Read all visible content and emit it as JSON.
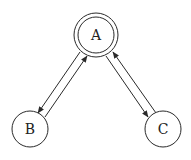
{
  "diagram": {
    "type": "state-graph",
    "stroke_color": "#2a2a2a",
    "background": "#ffffff",
    "nodes": [
      {
        "id": "A",
        "label": "A",
        "cx": 96,
        "cy": 35,
        "r": 22,
        "double": true,
        "inner_r": 18
      },
      {
        "id": "B",
        "label": "B",
        "cx": 30,
        "cy": 129,
        "r": 18,
        "double": false
      },
      {
        "id": "C",
        "label": "C",
        "cx": 163,
        "cy": 129,
        "r": 18,
        "double": false
      }
    ],
    "edges": [
      {
        "from": "A",
        "to": "B",
        "x1": 80,
        "y1": 52,
        "x2": 38,
        "y2": 113
      },
      {
        "from": "B",
        "to": "A",
        "x1": 45,
        "y1": 117,
        "x2": 87,
        "y2": 56
      },
      {
        "from": "A",
        "to": "C",
        "x1": 106,
        "y1": 56,
        "x2": 148,
        "y2": 117
      },
      {
        "from": "C",
        "to": "A",
        "x1": 156,
        "y1": 113,
        "x2": 113,
        "y2": 52
      }
    ]
  }
}
